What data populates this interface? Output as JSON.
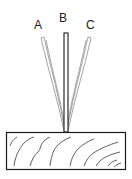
{
  "diagram": {
    "labels": {
      "a": "A",
      "b": "B",
      "c": "C"
    },
    "colors": {
      "outline": "#1a1a1a",
      "strip_light": "#9a9a9a",
      "background": "#ffffff"
    }
  }
}
